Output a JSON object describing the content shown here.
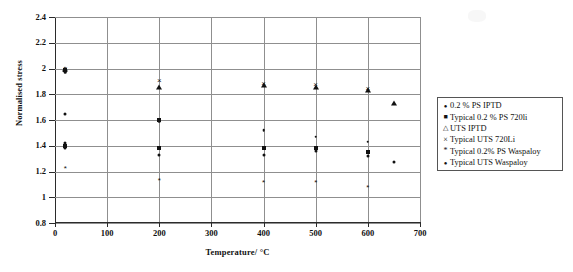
{
  "chart_data": {
    "type": "scatter",
    "title": "",
    "xlabel": "Temperature/ °C",
    "ylabel": "Normalised stress",
    "xlim": [
      0,
      700
    ],
    "ylim": [
      0.8,
      2.4
    ],
    "xticks": [
      0,
      100,
      200,
      300,
      400,
      500,
      600,
      700
    ],
    "yticks": [
      0.8,
      1,
      1.2,
      1.4,
      1.6,
      1.8,
      2,
      2.2,
      2.4
    ],
    "xtick_labels": [
      "0",
      "100",
      "200",
      "300",
      "400",
      "500",
      "600",
      "700"
    ],
    "ytick_labels": [
      "0.8",
      "1",
      "1.2",
      "1.4",
      "1.6",
      "1.8",
      "2",
      "2.2",
      "2.4"
    ],
    "grid": "horizontal-and-vertical",
    "legend_position": "right",
    "series": [
      {
        "name": "0.2 % PS  IPTD",
        "marker": "circle",
        "points": [
          {
            "x": 20,
            "y": 1.98
          },
          {
            "x": 20,
            "y": 1.65
          },
          {
            "x": 20,
            "y": 1.42
          },
          {
            "x": 20,
            "y": 1.38
          },
          {
            "x": 200,
            "y": 1.33
          },
          {
            "x": 400,
            "y": 1.33
          },
          {
            "x": 500,
            "y": 1.36
          },
          {
            "x": 600,
            "y": 1.32
          },
          {
            "x": 650,
            "y": 1.27
          }
        ]
      },
      {
        "name": "Typical 0.2 % PS 720Li",
        "marker": "square",
        "points": [
          {
            "x": 20,
            "y": 1.99
          },
          {
            "x": 20,
            "y": 1.4
          },
          {
            "x": 200,
            "y": 1.6
          },
          {
            "x": 200,
            "y": 1.38
          },
          {
            "x": 400,
            "y": 1.38
          },
          {
            "x": 500,
            "y": 1.38
          },
          {
            "x": 600,
            "y": 1.35
          }
        ]
      },
      {
        "name": "UTS  IPTD",
        "marker": "triangle",
        "points": [
          {
            "x": 20,
            "y": 2.0
          },
          {
            "x": 200,
            "y": 1.86
          },
          {
            "x": 400,
            "y": 1.87
          },
          {
            "x": 500,
            "y": 1.86
          },
          {
            "x": 600,
            "y": 1.83
          },
          {
            "x": 650,
            "y": 1.73
          }
        ]
      },
      {
        "name": "Typical UTS  720Li",
        "marker": "cross",
        "points": [
          {
            "x": 20,
            "y": 2.0
          },
          {
            "x": 200,
            "y": 1.9
          },
          {
            "x": 400,
            "y": 1.88
          },
          {
            "x": 500,
            "y": 1.87
          },
          {
            "x": 600,
            "y": 1.84
          }
        ]
      },
      {
        "name": "Typical 0.2% PS  Waspaloy",
        "marker": "star",
        "points": [
          {
            "x": 20,
            "y": 1.22
          },
          {
            "x": 200,
            "y": 1.13
          },
          {
            "x": 400,
            "y": 1.11
          },
          {
            "x": 500,
            "y": 1.11
          },
          {
            "x": 600,
            "y": 1.07
          }
        ]
      },
      {
        "name": "Typical UTS Waspaloy",
        "marker": "dot",
        "points": [
          {
            "x": 20,
            "y": 1.97
          },
          {
            "x": 200,
            "y": 1.59
          },
          {
            "x": 400,
            "y": 1.52
          },
          {
            "x": 500,
            "y": 1.47
          },
          {
            "x": 600,
            "y": 1.43
          }
        ]
      }
    ]
  },
  "axes": {
    "y_title": "Normalised stress",
    "x_title": "Temperature/ °C",
    "y_labels": [
      "2.4",
      "2.2",
      "2",
      "1.8",
      "1.6",
      "1.4",
      "1.2",
      "1",
      "0.8"
    ],
    "x_labels": [
      "0",
      "100",
      "200",
      "300",
      "400",
      "500",
      "600",
      "700"
    ]
  },
  "legend": {
    "items": [
      {
        "marker_name": "legend-marker-circle",
        "glyph": "●",
        "label": "0.2 % PS  IPTD"
      },
      {
        "marker_name": "legend-marker-square",
        "glyph": "■",
        "label": "Typical 0.2 % PS 720li"
      },
      {
        "marker_name": "legend-marker-triangle",
        "glyph": "△",
        "label": "UTS  IPTD"
      },
      {
        "marker_name": "legend-marker-cross",
        "glyph": "×",
        "label": "Typical UTS  720Li"
      },
      {
        "marker_name": "legend-marker-star",
        "glyph": "*",
        "label": "Typical 0.2% PS  Waspaloy"
      },
      {
        "marker_name": "legend-marker-dot",
        "glyph": "●",
        "label": "Typical UTS Waspaloy"
      }
    ]
  }
}
